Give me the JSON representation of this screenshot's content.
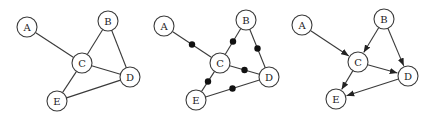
{
  "node_radius": 10,
  "colors": {
    "stroke": "#3a3a3a",
    "text": "#222222",
    "dot": "#111111",
    "background": "#ffffff"
  },
  "graphs": [
    {
      "id": "undirected",
      "nodes": [
        {
          "id": "A",
          "label": "A",
          "x": 27,
          "y": 27
        },
        {
          "id": "B",
          "label": "B",
          "x": 108,
          "y": 21
        },
        {
          "id": "C",
          "label": "C",
          "x": 82,
          "y": 63
        },
        {
          "id": "D",
          "label": "D",
          "x": 130,
          "y": 77
        },
        {
          "id": "E",
          "label": "E",
          "x": 57,
          "y": 101
        }
      ],
      "edges": [
        [
          "A",
          "C"
        ],
        [
          "B",
          "C"
        ],
        [
          "B",
          "D"
        ],
        [
          "C",
          "D"
        ],
        [
          "C",
          "E"
        ],
        [
          "E",
          "D"
        ]
      ],
      "directed": false,
      "midpoint_dots": false
    },
    {
      "id": "subdivided",
      "nodes": [
        {
          "id": "A",
          "label": "A",
          "x": 164,
          "y": 26
        },
        {
          "id": "B",
          "label": "B",
          "x": 246,
          "y": 20
        },
        {
          "id": "C",
          "label": "C",
          "x": 220,
          "y": 63
        },
        {
          "id": "D",
          "label": "D",
          "x": 269,
          "y": 77
        },
        {
          "id": "E",
          "label": "E",
          "x": 196,
          "y": 100
        }
      ],
      "edges": [
        [
          "A",
          "C"
        ],
        [
          "B",
          "C"
        ],
        [
          "B",
          "D"
        ],
        [
          "C",
          "D"
        ],
        [
          "C",
          "E"
        ],
        [
          "E",
          "D"
        ]
      ],
      "directed": false,
      "midpoint_dots": true
    },
    {
      "id": "directed",
      "nodes": [
        {
          "id": "A",
          "label": "A",
          "x": 302,
          "y": 25
        },
        {
          "id": "B",
          "label": "B",
          "x": 384,
          "y": 19
        },
        {
          "id": "C",
          "label": "C",
          "x": 358,
          "y": 62
        },
        {
          "id": "D",
          "label": "D",
          "x": 408,
          "y": 76
        },
        {
          "id": "E",
          "label": "E",
          "x": 336,
          "y": 99
        }
      ],
      "edges": [
        [
          "A",
          "C"
        ],
        [
          "B",
          "C"
        ],
        [
          "B",
          "D"
        ],
        [
          "C",
          "D"
        ],
        [
          "C",
          "E"
        ],
        [
          "D",
          "E"
        ]
      ],
      "directed": true,
      "midpoint_dots": false
    }
  ]
}
